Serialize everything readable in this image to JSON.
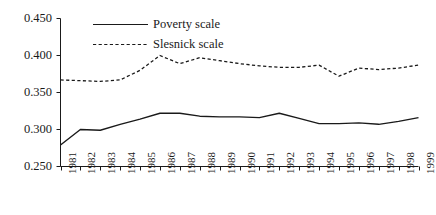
{
  "chart_data": {
    "type": "line",
    "title": "",
    "subtitle": "",
    "xlabel": "",
    "ylabel": "",
    "x": [
      1981,
      1982,
      1983,
      1984,
      1985,
      1986,
      1987,
      1988,
      1989,
      1990,
      1991,
      1992,
      1993,
      1994,
      1995,
      1996,
      1997,
      1998,
      1999
    ],
    "categories": [
      "1981",
      "1982",
      "1983",
      "1984",
      "1985",
      "1986",
      "1987",
      "1988",
      "1989",
      "1990",
      "1991",
      "1992",
      "1993",
      "1994",
      "1995",
      "1996",
      "1997",
      "1998",
      "1999"
    ],
    "xlim": [
      1981,
      1999
    ],
    "ylim": [
      0.25,
      0.45
    ],
    "yticks": [
      0.25,
      0.3,
      0.35,
      0.4,
      0.45
    ],
    "ytick_labels": [
      "0.250",
      "0.300",
      "0.350",
      "0.400",
      "0.450"
    ],
    "grid": false,
    "legend_position": "top-center",
    "series": [
      {
        "name": "Poverty scale",
        "style": "solid",
        "color": "#1a1a1a",
        "values": [
          0.279,
          0.3,
          0.299,
          0.307,
          0.314,
          0.322,
          0.322,
          0.318,
          0.317,
          0.317,
          0.316,
          0.322,
          0.315,
          0.308,
          0.308,
          0.309,
          0.307,
          0.311,
          0.316
        ]
      },
      {
        "name": "Slesnick scale",
        "style": "dashed",
        "color": "#1a1a1a",
        "values": [
          0.367,
          0.366,
          0.365,
          0.367,
          0.38,
          0.4,
          0.389,
          0.397,
          0.393,
          0.389,
          0.386,
          0.384,
          0.384,
          0.387,
          0.372,
          0.383,
          0.381,
          0.383,
          0.387
        ]
      }
    ]
  },
  "legend": {
    "entries": [
      {
        "label": "Poverty scale",
        "style": "solid"
      },
      {
        "label": "Slesnick scale",
        "style": "dashed"
      }
    ]
  }
}
